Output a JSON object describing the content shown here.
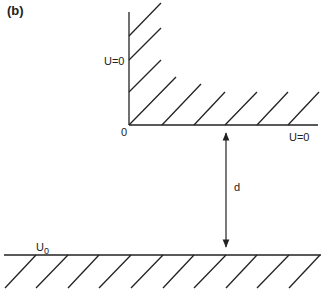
{
  "figure": {
    "panel_label": "(b)",
    "labels": {
      "wall_vertical": "U=0",
      "wall_horizontal": "U=0",
      "origin": "0",
      "gap": "d",
      "bottom_plate_main": "U",
      "bottom_plate_sub": "0"
    },
    "colors": {
      "line": "#222222",
      "background": "#ffffff"
    }
  }
}
